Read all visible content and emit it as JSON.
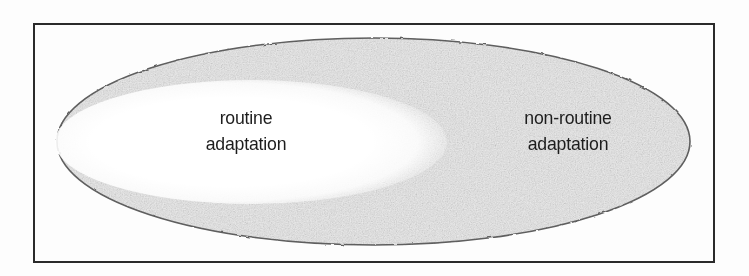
{
  "figure": {
    "kind": "venn-style-nested-ellipse-diagram",
    "background_color": "#ffffff",
    "border": {
      "name": "figure-frame",
      "color": "#2b2b2b",
      "x": 34,
      "y": 24,
      "width": 680,
      "height": 238,
      "stroke_width": 2
    },
    "outer_ellipse": {
      "name": "adaptation-space",
      "fill_color": "#ededed",
      "outline_color": "#5a5a5a",
      "cx": 373.5,
      "cy": 141.5,
      "rx": 316.5,
      "ry": 103.5
    },
    "inner_ellipse": {
      "name": "routine-region",
      "fill_color": "#ffffff",
      "outline_color": "none",
      "cx": 251,
      "cy": 142,
      "rx": 189,
      "ry": 58
    }
  },
  "labels": {
    "routine": {
      "line1": "routine",
      "line2": "adaptation",
      "region": "inner-white-ellipse",
      "text_color": "#1d1d1d",
      "center_x": 246,
      "center_y": 131
    },
    "non_routine": {
      "line1": "non-routine",
      "line2": "adaptation",
      "region": "outer-shaded-ellipse",
      "text_color": "#1d1d1d",
      "center_x": 568,
      "center_y": 131
    }
  }
}
